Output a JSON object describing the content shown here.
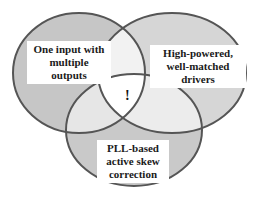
{
  "diagram": {
    "type": "venn",
    "sets": [
      {
        "id": "left",
        "label": "One input with multiple outputs"
      },
      {
        "id": "right",
        "label": "High-powered, well-matched drivers"
      },
      {
        "id": "bottom",
        "label": "PLL-based active skew correction"
      }
    ],
    "center_label": "!",
    "colors": {
      "outer_fill": "#c8c8c8",
      "pair_fill": "#e4e4e4",
      "center_fill": "#ffffff",
      "stroke": "#555555"
    }
  },
  "labels": {
    "left": [
      "One input with",
      "multiple",
      "outputs"
    ],
    "right": [
      "High-powered,",
      "well-matched",
      "drivers"
    ],
    "bottom": [
      "PLL-based",
      "active skew",
      "correction"
    ],
    "center": "!"
  }
}
